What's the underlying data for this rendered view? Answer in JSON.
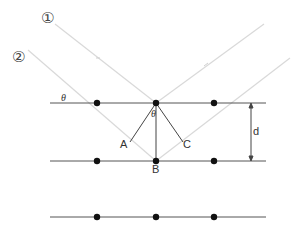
{
  "diagram": {
    "ray_labels": [
      "①",
      "②"
    ],
    "point_labels": {
      "A": "A",
      "B": "B",
      "C": "C"
    },
    "angle_label": "θ",
    "spacing_label": "d",
    "planes": [
      103,
      161,
      217
    ],
    "atoms_x": [
      97,
      156,
      214
    ],
    "colors": {
      "plane": "#555555",
      "ray": "#d8d8d8",
      "atom": "#111111",
      "construction": "#444444"
    }
  }
}
